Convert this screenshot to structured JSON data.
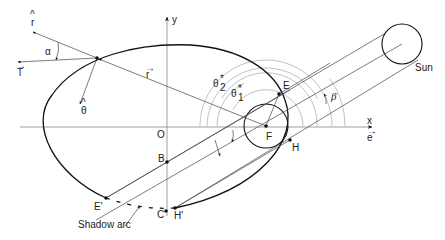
{
  "diagram": {
    "labels": {
      "y_axis": "y",
      "x_axis": "x",
      "x_unit_vector": "e",
      "origin": "O",
      "focus": "F",
      "point_E": "E",
      "point_H": "H",
      "point_E_prime": "E'",
      "point_H_prime": "H'",
      "point_B": "B",
      "point_C": "C",
      "sun": "Sun",
      "beta": "β",
      "alpha": "α",
      "theta1": "θ",
      "theta1_sub": "1",
      "theta1_sup": "*",
      "theta2": "θ",
      "theta2_sub": "2",
      "theta2_sup": "*",
      "r_hat": "r",
      "theta_hat": "θ",
      "thrust_vec": "T",
      "radius_vec": "r",
      "shadow_arc": "Shadow arc"
    },
    "colors": {
      "stroke": "#111111",
      "thin": "#444444",
      "grey": "#999999",
      "background": "#ffffff"
    }
  }
}
